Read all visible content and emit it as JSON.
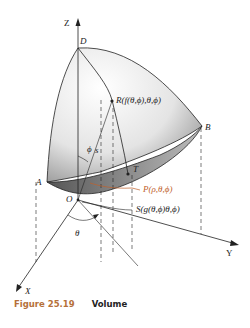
{
  "figure": {
    "number": "Figure 25.19",
    "title": "Volume",
    "accent_color": "#b5703a"
  },
  "labels": {
    "z_axis": "Z",
    "y_axis": "Y",
    "x_axis": "X",
    "point_d": "D",
    "point_a": "A",
    "point_b": "B",
    "point_o": "O",
    "point_t": "T",
    "point_r": "R(f(θ,ϕ),θ,ϕ)",
    "point_p": "P(ρ,θ,ϕ)",
    "point_s": "S(g(θ,ϕ)θ,ϕ)",
    "angle_phi": "ϕ",
    "arc_s": "s",
    "angle_theta": "θ"
  },
  "colors": {
    "surface_light": "#f2f2f2",
    "surface_dark": "#7a7a7a",
    "line": "#222222",
    "orange": "#c0602a"
  }
}
